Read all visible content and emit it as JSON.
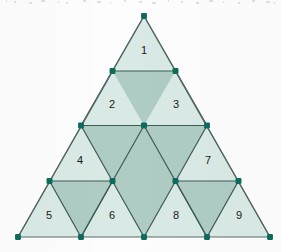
{
  "figure": {
    "background_color": "#fdfdfd",
    "colors": {
      "light_fill": "#d9e9e5",
      "dark_fill": "#aecbc4",
      "edge_stroke": "#5a6a6a",
      "inner_stroke": "#3c5a56",
      "vertex_dot": "#0e6b5c",
      "label_text": "#1a1a1a"
    },
    "geometry": {
      "apex": {
        "x": 144,
        "y": 16
      },
      "bottom_left": {
        "x": 17,
        "y": 237
      },
      "bottom_right": {
        "x": 270,
        "y": 237
      },
      "row_y": [
        16,
        71,
        125.5,
        181,
        237
      ],
      "edge_stroke_width": 1.2,
      "vertex_radius": 3.2
    },
    "labels": [
      {
        "id": "label-1",
        "text": "1",
        "x": 144,
        "y": 51,
        "shade": "light"
      },
      {
        "id": "label-2",
        "text": "2",
        "x": 112,
        "y": 105,
        "shade": "light"
      },
      {
        "id": "label-3",
        "text": "3",
        "x": 176,
        "y": 105,
        "shade": "light"
      },
      {
        "id": "label-4",
        "text": "4",
        "x": 80,
        "y": 161,
        "shade": "light"
      },
      {
        "id": "label-5",
        "text": "5",
        "x": 49,
        "y": 216,
        "shade": "light"
      },
      {
        "id": "label-6",
        "text": "6",
        "x": 112,
        "y": 216,
        "shade": "light"
      },
      {
        "id": "label-7",
        "text": "7",
        "x": 208,
        "y": 161,
        "shade": "light"
      },
      {
        "id": "label-8",
        "text": "8",
        "x": 176,
        "y": 216,
        "shade": "light"
      },
      {
        "id": "label-9",
        "text": "9",
        "x": 239,
        "y": 216,
        "shade": "light"
      }
    ],
    "light_triangles": [
      {
        "id": "tri-1",
        "points": "144,16 112.5,71 175.5,71"
      },
      {
        "id": "tri-2",
        "points": "112.5,71 81,125.5 144,125.5"
      },
      {
        "id": "tri-3",
        "points": "175.5,71 144,125.5 207,125.5"
      },
      {
        "id": "tri-4",
        "points": "81,125.5 49.5,181 112.5,181"
      },
      {
        "id": "tri-5",
        "points": "49.5,181 18,237 81,237"
      },
      {
        "id": "tri-6",
        "points": "112.5,181 81,237 144,237"
      },
      {
        "id": "tri-7",
        "points": "207,125.5 175.5,181 238.5,181"
      },
      {
        "id": "tri-8",
        "points": "175.5,181 144,237 207,237"
      },
      {
        "id": "tri-9",
        "points": "238.5,181 207,237 270,237"
      }
    ],
    "dark_triangles": [
      {
        "id": "dark-center-big",
        "points": "81,125.5 207,125.5 144,237"
      },
      {
        "id": "dark-top",
        "points": "112.5,71 175.5,71 144,125.5"
      },
      {
        "id": "dark-left",
        "points": "49.5,181 112.5,181 81,237"
      },
      {
        "id": "dark-right",
        "points": "175.5,181 238.5,181 207,237"
      }
    ],
    "vertices": [
      {
        "id": "v-apex",
        "x": 144,
        "y": 16
      },
      {
        "id": "v-mid-left-1",
        "x": 112.5,
        "y": 71
      },
      {
        "id": "v-mid-right-1",
        "x": 175.5,
        "y": 71
      },
      {
        "id": "v-row2-left",
        "x": 81,
        "y": 125.5
      },
      {
        "id": "v-row2-center",
        "x": 144,
        "y": 125.5
      },
      {
        "id": "v-row2-right",
        "x": 207,
        "y": 125.5
      },
      {
        "id": "v-row3-a",
        "x": 49.5,
        "y": 181
      },
      {
        "id": "v-row3-b",
        "x": 112.5,
        "y": 181
      },
      {
        "id": "v-row3-c",
        "x": 175.5,
        "y": 181
      },
      {
        "id": "v-row3-d",
        "x": 238.5,
        "y": 181
      },
      {
        "id": "v-row4-a",
        "x": 18,
        "y": 237
      },
      {
        "id": "v-row4-b",
        "x": 81,
        "y": 237
      },
      {
        "id": "v-row4-c",
        "x": 144,
        "y": 237
      },
      {
        "id": "v-row4-d",
        "x": 207,
        "y": 237
      },
      {
        "id": "v-row4-e",
        "x": 270,
        "y": 237
      }
    ],
    "inner_edges": [
      {
        "id": "edge-h-row1",
        "x1": 112.5,
        "y1": 71,
        "x2": 175.5,
        "y2": 71
      },
      {
        "id": "edge-h-row2",
        "x1": 81,
        "y1": 125.5,
        "x2": 207,
        "y2": 125.5
      },
      {
        "id": "edge-h-row3-left",
        "x1": 49.5,
        "y1": 181,
        "x2": 112.5,
        "y2": 181
      },
      {
        "id": "edge-h-row3-right",
        "x1": 175.5,
        "y1": 181,
        "x2": 238.5,
        "y2": 181
      },
      {
        "id": "edge-d1",
        "x1": 112.5,
        "y1": 71,
        "x2": 18,
        "y2": 237
      },
      {
        "id": "edge-d2",
        "x1": 175.5,
        "y1": 71,
        "x2": 270,
        "y2": 237
      },
      {
        "id": "edge-d3",
        "x1": 81,
        "y1": 125.5,
        "x2": 144,
        "y2": 16
      },
      {
        "id": "edge-d4",
        "x1": 207,
        "y1": 125.5,
        "x2": 144,
        "y2": 16
      },
      {
        "id": "edge-d5",
        "x1": 144,
        "y1": 125.5,
        "x2": 81,
        "y2": 237
      },
      {
        "id": "edge-d6",
        "x1": 144,
        "y1": 125.5,
        "x2": 207,
        "y2": 237
      },
      {
        "id": "edge-d7",
        "x1": 81,
        "y1": 125.5,
        "x2": 144,
        "y2": 237
      },
      {
        "id": "edge-d8",
        "x1": 207,
        "y1": 125.5,
        "x2": 144,
        "y2": 237
      },
      {
        "id": "edge-d9",
        "x1": 49.5,
        "y1": 181,
        "x2": 81,
        "y2": 237
      },
      {
        "id": "edge-d10",
        "x1": 112.5,
        "y1": 181,
        "x2": 81,
        "y2": 237
      },
      {
        "id": "edge-d11",
        "x1": 175.5,
        "y1": 181,
        "x2": 207,
        "y2": 237
      },
      {
        "id": "edge-d12",
        "x1": 238.5,
        "y1": 181,
        "x2": 207,
        "y2": 237
      }
    ],
    "outer_edges": [
      {
        "id": "edge-outer-left",
        "x1": 144,
        "y1": 16,
        "x2": 18,
        "y2": 237
      },
      {
        "id": "edge-outer-right",
        "x1": 144,
        "y1": 16,
        "x2": 270,
        "y2": 237
      },
      {
        "id": "edge-outer-bottom",
        "x1": 18,
        "y1": 237,
        "x2": 270,
        "y2": 237
      }
    ]
  }
}
